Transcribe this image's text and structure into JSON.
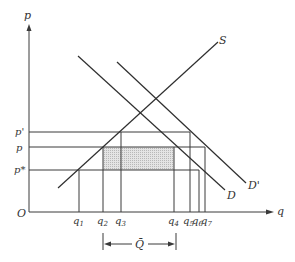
{
  "diagram": {
    "type": "supply-demand",
    "axes": {
      "y_label": "p",
      "x_label": "q",
      "origin_label": "O"
    },
    "curves": {
      "supply": "S",
      "demand": "D",
      "demand_shifted": "D'"
    },
    "price_levels": [
      {
        "label": "p'",
        "name": "p-prime"
      },
      {
        "label": "p",
        "name": "p"
      },
      {
        "label": "p*",
        "name": "p-star"
      }
    ],
    "quantity_levels": [
      {
        "base": "q",
        "sub": "1"
      },
      {
        "base": "q",
        "sub": "2"
      },
      {
        "base": "q",
        "sub": "3"
      },
      {
        "base": "q",
        "sub": "4"
      },
      {
        "base": "q",
        "sub": "5"
      },
      {
        "base": "q",
        "sub": "6"
      },
      {
        "base": "q",
        "sub": "7"
      }
    ],
    "quota_label": "Q̄",
    "shaded_region": "rectangle between p and p*, from q2 to q4",
    "colors": {
      "line": "#3a3a3a",
      "shade": "#d8d8d8",
      "background": "#ffffff"
    }
  }
}
